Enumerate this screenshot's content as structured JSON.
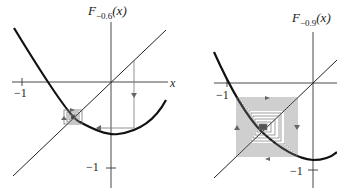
{
  "panels": [
    {
      "title_base": "F",
      "title_sub": "−0.6",
      "title_arg": "(x)",
      "x_axis_label": "x",
      "tick_x": "−1",
      "tick_y": "−1"
    },
    {
      "title_base": "F",
      "title_sub": "−0.9",
      "title_arg": "(x)",
      "tick_x": "−1",
      "tick_y": "−1"
    }
  ],
  "colors": {
    "curve": "#111111",
    "axis": "#333333",
    "cobweb": "#777777"
  }
}
